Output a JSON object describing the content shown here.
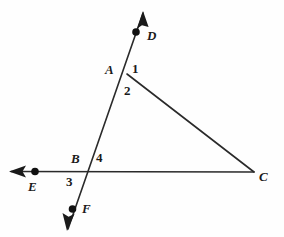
{
  "figure": {
    "kind": "geometry-diagram",
    "background_color": "#fefefe",
    "stroke_color": "#2a2a2a",
    "label_color": "#1a1a1a",
    "width": 284,
    "height": 237
  },
  "points": [
    {
      "id": "D",
      "label": "D",
      "dot_x": 136,
      "dot_y": 32,
      "label_x": 147,
      "label_y": 30,
      "has_dot": true
    },
    {
      "id": "A",
      "label": "A",
      "dot_x": 127,
      "dot_y": 73,
      "label_x": 106,
      "label_y": 63,
      "has_dot": false
    },
    {
      "id": "B",
      "label": "B",
      "dot_x": 88,
      "dot_y": 172,
      "label_x": 72,
      "label_y": 152,
      "has_dot": false
    },
    {
      "id": "C",
      "label": "C",
      "dot_x": 254,
      "dot_y": 172,
      "label_x": 259,
      "label_y": 170,
      "has_dot": false
    },
    {
      "id": "E",
      "label": "E",
      "dot_x": 35,
      "dot_y": 171,
      "label_x": 28,
      "label_y": 180,
      "has_dot": true
    },
    {
      "id": "F",
      "label": "F",
      "dot_x": 72,
      "dot_y": 209,
      "label_x": 82,
      "label_y": 202,
      "has_dot": true
    }
  ],
  "angle_labels": [
    {
      "id": "angle-1",
      "label": "1",
      "x": 132,
      "y": 62
    },
    {
      "id": "angle-2",
      "label": "2",
      "x": 124,
      "y": 84
    },
    {
      "id": "angle-3",
      "label": "3",
      "x": 67,
      "y": 175
    },
    {
      "id": "angle-4",
      "label": "4",
      "x": 96,
      "y": 152
    }
  ],
  "segments": [
    {
      "id": "ray-DF-line",
      "from": [
        143,
        13
      ],
      "to": [
        68,
        229
      ],
      "name": "line-DF"
    },
    {
      "id": "segment-AC",
      "from": [
        127,
        74
      ],
      "to": [
        254,
        172
      ],
      "name": "segment-AC"
    },
    {
      "id": "ray-EC-line",
      "from": [
        11,
        171
      ],
      "to": [
        254,
        172
      ],
      "name": "line-EC"
    }
  ],
  "arrowheads": [
    {
      "id": "arrow-D",
      "tip": [
        143,
        13
      ],
      "angle_deg": -109
    },
    {
      "id": "arrow-F",
      "tip": [
        68,
        229
      ],
      "angle_deg": 71
    },
    {
      "id": "arrow-E",
      "tip": [
        11,
        171
      ],
      "angle_deg": 180
    }
  ]
}
